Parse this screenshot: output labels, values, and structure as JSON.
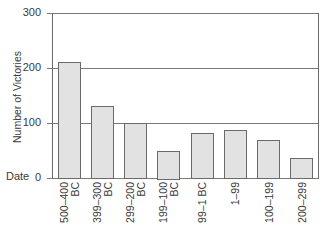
{
  "chart_data": {
    "type": "bar",
    "title": "",
    "xlabel": "Date",
    "ylabel": "Number of Victories",
    "categories": [
      "500–400 BC",
      "399–300 BC",
      "299–200 BC",
      "199–100 BC",
      "99–1 BC",
      "1–99",
      "100–199",
      "200–299"
    ],
    "category_lines": [
      [
        "500–400",
        "BC"
      ],
      [
        "399–300",
        "BC"
      ],
      [
        "299–200",
        "BC"
      ],
      [
        "199–100",
        "BC"
      ],
      [
        "99–1 BC"
      ],
      [
        "1–99"
      ],
      [
        "100–199"
      ],
      [
        "200–299"
      ]
    ],
    "values": [
      211,
      131,
      100,
      50,
      82,
      88,
      69,
      37
    ],
    "ylim": [
      0,
      300
    ],
    "yticks": [
      0,
      100,
      200,
      300
    ],
    "grid": "horizontal",
    "legend": null,
    "colors": {
      "bar_fill": "#e2e2e2",
      "bar_stroke": "#6a6a6a",
      "grid": "#7a7a7a",
      "axis": "#6a6a6a"
    }
  }
}
